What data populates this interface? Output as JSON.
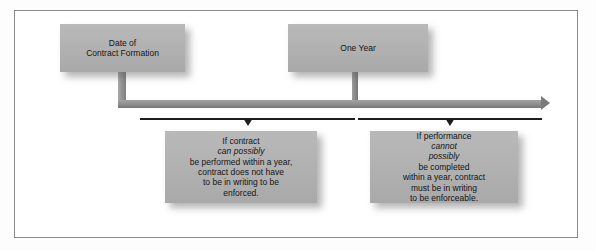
{
  "diagram": {
    "nodes": {
      "date_of_contract_formation": {
        "line1": "Date of",
        "line2": "Contract Formation"
      },
      "one_year": {
        "label": "One Year"
      },
      "left_note": {
        "line1_a": "If contract ",
        "line1_em": "can possibly",
        "line2": "be performed within a year,",
        "line3": "contract does not have",
        "line4": "to be in writing to be",
        "line5": "enforced."
      },
      "right_note": {
        "line1_a": "If performance ",
        "line1_em": "cannot",
        "line2_em": "possibly",
        "line2_b": " be completed",
        "line3": "within a year, contract",
        "line4": "must be in writing",
        "line5": "to be enforceable."
      }
    },
    "colors": {
      "box_fill": "#b2b2b2",
      "timeline": "#8d8d8d",
      "bracket": "#1c1c1c",
      "frame_border": "#8b8b8b",
      "text": "#141414"
    }
  }
}
